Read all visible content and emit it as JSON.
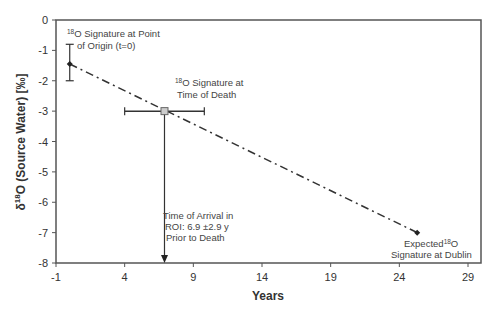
{
  "chart_data": {
    "type": "line",
    "title": "",
    "xlabel": "Years",
    "ylabel": "δ18O (Source Water) [‰]",
    "ylabel_parts": {
      "delta": "δ",
      "sup": "18",
      "rest": "O (Source Water) [‰]"
    },
    "xlim": [
      -1,
      30
    ],
    "ylim": [
      -8,
      0
    ],
    "x_ticks": [
      -1,
      4,
      9,
      14,
      19,
      24,
      29
    ],
    "y_ticks": [
      0,
      -1,
      -2,
      -3,
      -4,
      -5,
      -6,
      -7,
      -8
    ],
    "grid": false,
    "legend": null,
    "series": [
      {
        "name": "Trend line (dash-dot)",
        "x": [
          0,
          25.3
        ],
        "y": [
          -1.45,
          -7.0
        ]
      }
    ],
    "points": [
      {
        "name": "Point of Origin",
        "x": 0,
        "y": -1.45,
        "y_err_low": -2.0,
        "y_err_high": -0.8,
        "marker": "diamond"
      },
      {
        "name": "Time of Death",
        "x": 6.9,
        "y": -3.0,
        "x_err_low": 4.0,
        "x_err_high": 9.8,
        "marker": "square"
      },
      {
        "name": "Dublin",
        "x": 25.3,
        "y": -7.0,
        "marker": "diamond"
      }
    ],
    "arrow": {
      "x": 6.9,
      "from_y": -3.0,
      "to_y": -8.0
    },
    "annotations": [
      {
        "id": "origin",
        "lines": [
          "18|O Signature at Point",
          "of Origin (t=0)"
        ]
      },
      {
        "id": "death",
        "lines": [
          "18|O Signature at",
          "Time of Death"
        ]
      },
      {
        "id": "arrival",
        "lines": [
          "Time of Arrival in",
          "ROI: 6.9 ±2.9 y",
          "Prior to Death"
        ]
      },
      {
        "id": "dublin",
        "lines": [
          "Expected 18|O",
          "Signature at Dublin"
        ]
      }
    ]
  },
  "labels": {
    "xlabel": "Years",
    "ann_origin_sup": "18",
    "ann_origin_l1": "O Signature at Point",
    "ann_origin_l2": "of Origin (t=0)",
    "ann_death_sup": "18",
    "ann_death_l1": "O Signature at",
    "ann_death_l2": "Time of Death",
    "ann_arrival_l1": "Time of Arrival in",
    "ann_arrival_l2": "ROI: 6.9 ±2.9 y",
    "ann_arrival_l3": "Prior to Death",
    "ann_dublin_l1a": "Expected",
    "ann_dublin_sup": "18",
    "ann_dublin_l1b": "O",
    "ann_dublin_l2": "Signature at Dublin",
    "ylabel_delta": "δ",
    "ylabel_sup": "18",
    "ylabel_rest": "O (Source Water) [‰]"
  }
}
